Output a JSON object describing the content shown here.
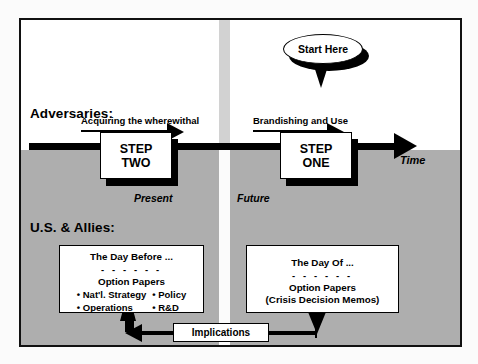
{
  "diagram": {
    "timeline_axis_label": "Time",
    "eras": {
      "left": "Present",
      "right": "Future"
    },
    "rows": {
      "adversaries_label": "Adversaries:",
      "allies_label": "U.S. & Allies:"
    },
    "callout": {
      "text": "Start Here"
    },
    "steps": [
      {
        "id": "step-two",
        "line1": "STEP",
        "line2": "TWO",
        "caption": "Acquiring the wherewithal"
      },
      {
        "id": "step-one",
        "line1": "STEP",
        "line2": "ONE",
        "caption": "Brandishing and Use"
      }
    ],
    "papers": [
      {
        "id": "day-before",
        "title": "The Day Before ...",
        "dashes": "- - - - - -",
        "subtitle": "Option Papers",
        "col_left": [
          "• Nat'l. Strategy",
          "• Operations"
        ],
        "col_right": [
          "• Policy",
          "• R&D"
        ],
        "note": ""
      },
      {
        "id": "day-of",
        "title": "The Day Of ...",
        "dashes": "- - - - - -",
        "subtitle": "Option Papers",
        "col_left": [],
        "col_right": [],
        "note": "(Crisis Decision Memos)"
      }
    ],
    "connector": {
      "label": "Implications"
    },
    "colors": {
      "ink": "#000000",
      "panel_top": "#ffffff",
      "panel_bottom": "#aeaeae",
      "divider": "#d2d2d2",
      "frame": "#111111"
    }
  }
}
